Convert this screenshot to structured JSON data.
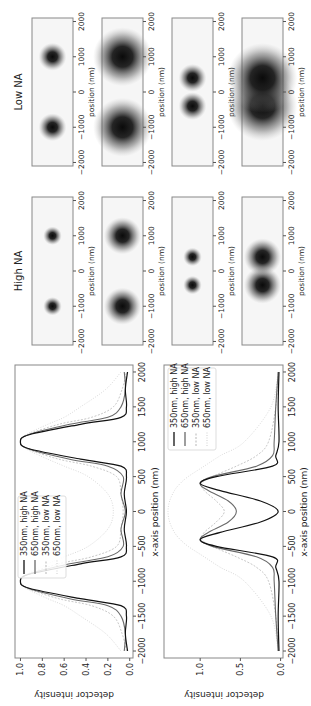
{
  "figure": {
    "orientation": "rotated 90deg counter-clockwise",
    "colors": {
      "350_high": "#111111",
      "650_high": "#6a6a6a",
      "350_low": "#c8c8c8",
      "650_low": "#dadada",
      "frame": "#888888"
    }
  },
  "chart_data": [
    {
      "type": "line",
      "title": "",
      "xlabel": "x-axis position (nm)",
      "ylabel": "detector intensity",
      "xlim": [
        -2100,
        2100
      ],
      "ylim": [
        -0.03,
        1.05
      ],
      "xticks": [
        -2000,
        -1500,
        -1000,
        -500,
        0,
        500,
        1000,
        1500,
        2000
      ],
      "yticks": [
        "0.0",
        "0.2",
        "0.4",
        "0.6",
        "0.8",
        "1.0"
      ],
      "legend": [
        "350nm, high NA",
        "650nm, high NA",
        "350nm, low NA",
        "650nm, low NA"
      ],
      "legend_position": "upper center",
      "grid": false,
      "description": "Two point sources at x = -1000 nm and +1000 nm",
      "x": [
        -2000,
        -1750,
        -1500,
        -1350,
        -1250,
        -1100,
        -1000,
        -900,
        -750,
        -650,
        -500,
        -250,
        0,
        250,
        500,
        650,
        750,
        900,
        1000,
        1100,
        1250,
        1350,
        1500,
        1750,
        2000
      ],
      "series": [
        {
          "name": "350nm, high NA",
          "values": [
            0.02,
            0.04,
            0.03,
            0.08,
            0.45,
            0.92,
            1.0,
            0.92,
            0.45,
            0.08,
            0.03,
            0.05,
            0.03,
            0.05,
            0.03,
            0.08,
            0.45,
            0.92,
            1.0,
            0.92,
            0.45,
            0.08,
            0.03,
            0.04,
            0.02
          ]
        },
        {
          "name": "650nm, high NA",
          "values": [
            0.05,
            0.04,
            0.08,
            0.2,
            0.55,
            0.93,
            1.0,
            0.93,
            0.55,
            0.2,
            0.06,
            0.08,
            0.04,
            0.08,
            0.06,
            0.2,
            0.55,
            0.93,
            1.0,
            0.93,
            0.55,
            0.2,
            0.08,
            0.04,
            0.05
          ]
        },
        {
          "name": "350nm, low NA",
          "values": [
            0.03,
            0.07,
            0.15,
            0.35,
            0.65,
            0.94,
            1.0,
            0.94,
            0.65,
            0.35,
            0.12,
            0.08,
            0.06,
            0.08,
            0.12,
            0.35,
            0.65,
            0.94,
            1.0,
            0.94,
            0.65,
            0.35,
            0.15,
            0.07,
            0.03
          ]
        },
        {
          "name": "650nm, low NA",
          "values": [
            0.08,
            0.22,
            0.45,
            0.6,
            0.75,
            0.95,
            1.0,
            0.95,
            0.75,
            0.6,
            0.38,
            0.2,
            0.15,
            0.2,
            0.38,
            0.6,
            0.75,
            0.95,
            1.0,
            0.95,
            0.75,
            0.6,
            0.45,
            0.22,
            0.08
          ]
        }
      ]
    },
    {
      "type": "line",
      "title": "",
      "xlabel": "x-axis position (nm)",
      "ylabel": "detector intensity",
      "xlim": [
        -2100,
        2100
      ],
      "ylim": [
        -0.03,
        1.45
      ],
      "xticks": [
        -2000,
        -1500,
        -1000,
        -500,
        0,
        500,
        1000,
        1500,
        2000
      ],
      "yticks": [
        "0.0",
        "0.5",
        "1.0"
      ],
      "legend": [
        "350nm, high NA",
        "650nm, high NA",
        "350nm, low NA",
        "650nm, low NA"
      ],
      "legend_position": "upper right",
      "grid": false,
      "description": "Two point sources at x = -400 nm and +400 nm",
      "x": [
        -2000,
        -1500,
        -1000,
        -800,
        -650,
        -500,
        -400,
        -300,
        -150,
        0,
        150,
        300,
        400,
        500,
        650,
        800,
        1000,
        1500,
        2000
      ],
      "series": [
        {
          "name": "350nm, high NA",
          "values": [
            0.02,
            0.03,
            0.02,
            0.06,
            0.1,
            0.8,
            1.0,
            0.75,
            0.25,
            0.03,
            0.25,
            0.75,
            1.0,
            0.8,
            0.1,
            0.06,
            0.02,
            0.03,
            0.02
          ]
        },
        {
          "name": "650nm, high NA",
          "values": [
            0.03,
            0.06,
            0.08,
            0.1,
            0.3,
            0.85,
            1.0,
            0.9,
            0.65,
            0.55,
            0.65,
            0.9,
            1.0,
            0.85,
            0.3,
            0.1,
            0.08,
            0.06,
            0.03
          ]
        },
        {
          "name": "350nm, low NA",
          "values": [
            0.03,
            0.06,
            0.15,
            0.3,
            0.55,
            0.85,
            0.98,
            0.95,
            0.8,
            0.7,
            0.8,
            0.95,
            0.98,
            0.85,
            0.55,
            0.3,
            0.15,
            0.06,
            0.03
          ]
        },
        {
          "name": "650nm, low NA",
          "values": [
            0.03,
            0.12,
            0.45,
            0.75,
            0.95,
            1.15,
            1.25,
            1.32,
            1.38,
            1.4,
            1.38,
            1.32,
            1.25,
            1.15,
            0.95,
            0.75,
            0.45,
            0.12,
            0.03
          ]
        }
      ]
    },
    {
      "type": "heatmap",
      "title": "High NA",
      "xlabel": "position (nm)",
      "xticks": [
        -2000,
        -1000,
        0,
        1000,
        2000
      ],
      "panels": [
        {
          "row": 1,
          "sources_nm": [
            -1000,
            1000
          ],
          "spot_sigma_nm": 120
        },
        {
          "row": 2,
          "sources_nm": [
            -1000,
            1000
          ],
          "spot_sigma_nm": 240
        },
        {
          "row": 3,
          "sources_nm": [
            -400,
            400
          ],
          "spot_sigma_nm": 120
        },
        {
          "row": 4,
          "sources_nm": [
            -400,
            400
          ],
          "spot_sigma_nm": 240
        }
      ]
    },
    {
      "type": "heatmap",
      "title": "Low NA",
      "xlabel": "position (nm)",
      "xticks": [
        -2000,
        -1000,
        0,
        1000,
        2000
      ],
      "panels": [
        {
          "row": 1,
          "sources_nm": [
            -1000,
            1000
          ],
          "spot_sigma_nm": 180
        },
        {
          "row": 2,
          "sources_nm": [
            -1000,
            1000
          ],
          "spot_sigma_nm": 380
        },
        {
          "row": 3,
          "sources_nm": [
            -400,
            400
          ],
          "spot_sigma_nm": 180
        },
        {
          "row": 4,
          "sources_nm": [
            -400,
            400
          ],
          "spot_sigma_nm": 450
        }
      ]
    }
  ]
}
